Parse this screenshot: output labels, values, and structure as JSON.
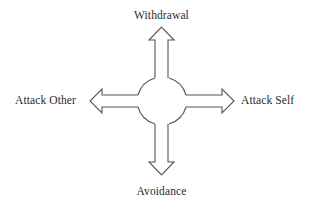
{
  "diagram": {
    "type": "four-directional-arrow-diagram",
    "center": {
      "shape": "circle",
      "label": ""
    },
    "arrows": [
      {
        "direction": "up",
        "label": "Withdrawal"
      },
      {
        "direction": "down",
        "label": "Avoidance"
      },
      {
        "direction": "left",
        "label": "Attack Other"
      },
      {
        "direction": "right",
        "label": "Attack Self"
      }
    ],
    "colors": {
      "stroke": "#555555",
      "text": "#2b2b2b",
      "background": "#ffffff"
    }
  }
}
